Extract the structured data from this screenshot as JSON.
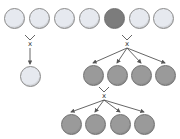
{
  "colors": {
    "light_fill": "#e6e9ef",
    "light_stroke": "#8a8a8a",
    "dark_fill": "#9a9a9a",
    "dark_stroke": "#6e6e6e",
    "highlight_fill": "#7c7c7c",
    "arrow": "#555555"
  },
  "cross_label": "x",
  "rows": {
    "top": [
      {
        "cx": 14,
        "cy": 18,
        "type": "light"
      },
      {
        "cx": 39,
        "cy": 18,
        "type": "light"
      },
      {
        "cx": 64,
        "cy": 18,
        "type": "light"
      },
      {
        "cx": 89,
        "cy": 18,
        "type": "light"
      },
      {
        "cx": 114,
        "cy": 18,
        "type": "highlight"
      },
      {
        "cx": 139,
        "cy": 18,
        "type": "light"
      },
      {
        "cx": 163,
        "cy": 18,
        "type": "light"
      }
    ],
    "left_result": [
      {
        "cx": 30,
        "cy": 76,
        "type": "light"
      }
    ],
    "middle": [
      {
        "cx": 93,
        "cy": 75,
        "type": "dark"
      },
      {
        "cx": 117,
        "cy": 75,
        "type": "dark"
      },
      {
        "cx": 141,
        "cy": 75,
        "type": "dark"
      },
      {
        "cx": 165,
        "cy": 75,
        "type": "dark"
      }
    ],
    "bottom": [
      {
        "cx": 71,
        "cy": 124,
        "type": "dark"
      },
      {
        "cx": 95,
        "cy": 124,
        "type": "dark"
      },
      {
        "cx": 120,
        "cy": 124,
        "type": "dark"
      },
      {
        "cx": 144,
        "cy": 124,
        "type": "dark"
      }
    ]
  },
  "branches": [
    {
      "x": 30,
      "y": 40,
      "targets": [
        [
          30,
          64
        ]
      ]
    },
    {
      "x": 127,
      "y": 40,
      "targets": [
        [
          93,
          63
        ],
        [
          117,
          63
        ],
        [
          141,
          63
        ],
        [
          165,
          63
        ]
      ]
    },
    {
      "x": 104,
      "y": 92,
      "targets": [
        [
          71,
          112
        ],
        [
          95,
          112
        ],
        [
          120,
          112
        ],
        [
          144,
          112
        ]
      ]
    }
  ]
}
